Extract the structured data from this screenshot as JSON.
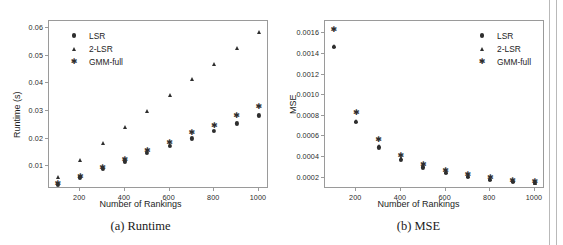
{
  "figure": {
    "panels": [
      {
        "id": "panel-a",
        "caption": "(a) Runtime",
        "chart_index": 0
      },
      {
        "id": "panel-b",
        "caption": "(b) MSE",
        "chart_index": 1
      }
    ]
  },
  "chart_data": [
    {
      "type": "scatter",
      "title": "(a) Runtime",
      "xlabel": "Number of Rankings",
      "ylabel": "Runtime (s)",
      "x": [
        100,
        200,
        300,
        400,
        500,
        600,
        700,
        800,
        900,
        1000
      ],
      "xlim": [
        60,
        1045
      ],
      "ylim": [
        0.0018,
        0.0625
      ],
      "xticks": [
        200,
        400,
        600,
        800,
        1000
      ],
      "xticklabels": [
        "200",
        "400",
        "600",
        "800",
        "1000"
      ],
      "yticks": [
        0.01,
        0.02,
        0.03,
        0.04,
        0.05,
        0.06
      ],
      "yticklabels": [
        "0.01",
        "0.02",
        "0.03",
        "0.04",
        "0.05",
        "0.06"
      ],
      "grid": false,
      "legend_position": "upper left",
      "series": [
        {
          "name": "LSR",
          "marker": "circle",
          "values": [
            0.0033,
            0.006,
            0.009,
            0.0118,
            0.0147,
            0.0173,
            0.0201,
            0.0229,
            0.0255,
            0.0284
          ]
        },
        {
          "name": "2-LSR",
          "marker": "triangle",
          "values": [
            0.0063,
            0.0124,
            0.0185,
            0.0241,
            0.0301,
            0.0358,
            0.0414,
            0.047,
            0.0529,
            0.0585
          ]
        },
        {
          "name": "GMM-full",
          "marker": "star",
          "values": [
            0.0035,
            0.0062,
            0.0094,
            0.0124,
            0.0154,
            0.0184,
            0.022,
            0.0247,
            0.0281,
            0.0313
          ]
        }
      ]
    },
    {
      "type": "scatter",
      "title": "(b) MSE",
      "xlabel": "Number of Rankings",
      "ylabel": "MSE",
      "x": [
        100,
        200,
        300,
        400,
        500,
        600,
        700,
        800,
        900,
        1000
      ],
      "xlim": [
        60,
        1045
      ],
      "ylim": [
        9e-05,
        0.00172
      ],
      "xticks": [
        200,
        400,
        600,
        800,
        1000
      ],
      "xticklabels": [
        "200",
        "400",
        "600",
        "800",
        "1000"
      ],
      "yticks": [
        0.0002,
        0.0004,
        0.0006,
        0.0008,
        0.001,
        0.0012,
        0.0014,
        0.0016
      ],
      "yticklabels": [
        "0.0002",
        "0.0004",
        "0.0006",
        "0.0008",
        "0.0010",
        "0.0012",
        "0.0014",
        "0.0016"
      ],
      "grid": false,
      "legend_position": "upper right",
      "series": [
        {
          "name": "LSR",
          "marker": "circle",
          "values": [
            0.001465,
            0.000742,
            0.000494,
            0.000376,
            0.000299,
            0.000249,
            0.000211,
            0.000182,
            0.00016,
            0.000146
          ]
        },
        {
          "name": "2-LSR",
          "marker": "triangle",
          "values": [
            0.001478,
            0.000754,
            0.000508,
            0.000388,
            0.000311,
            0.000258,
            0.000219,
            0.000189,
            0.000166,
            0.000151
          ]
        },
        {
          "name": "GMM-full",
          "marker": "star",
          "values": [
            0.001635,
            0.00083,
            0.000562,
            0.000412,
            0.000326,
            0.000268,
            0.000227,
            0.000194,
            0.00017,
            0.000155
          ]
        }
      ]
    }
  ],
  "legend": {
    "entries": [
      {
        "label": "LSR",
        "marker": "circle"
      },
      {
        "label": "2-LSR",
        "marker": "triangle"
      },
      {
        "label": "GMM-full",
        "marker": "star"
      }
    ]
  },
  "colors": {
    "marker": "#2e2e2e",
    "axis": "#9a9a9a",
    "text": "#1d1d1d",
    "background": "#ffffff"
  }
}
